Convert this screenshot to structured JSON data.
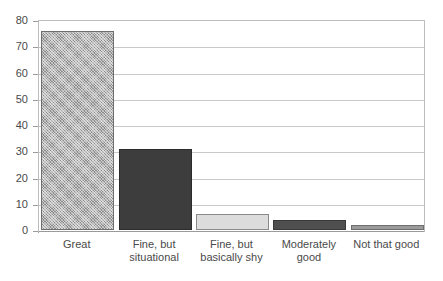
{
  "chart_data": {
    "type": "bar",
    "title": "",
    "subtitle": "",
    "xlabel": "",
    "ylabel": "",
    "categories": [
      "Great",
      "Fine, but\nsituational",
      "Fine, but\nbasically shy",
      "Moderately\ngood",
      "Not that good"
    ],
    "values": [
      76,
      31,
      6,
      4,
      2
    ],
    "ylim": [
      0,
      80
    ],
    "ytick_labels": [
      "0",
      "10",
      "20",
      "30",
      "40",
      "50",
      "60",
      "70",
      "80"
    ],
    "ytick_values": [
      0,
      10,
      20,
      30,
      40,
      50,
      60,
      70,
      80
    ],
    "grid": "horizontal",
    "legend": "none",
    "bar_styles": [
      {
        "fill": "hatched-gray",
        "color": "#8c8c8c",
        "edge": "#6e6e6e"
      },
      {
        "fill": "solid",
        "color": "#3d3d3d",
        "edge": "#2b2b2b"
      },
      {
        "fill": "solid",
        "color": "#dcdcdc",
        "edge": "#8a8a8a"
      },
      {
        "fill": "solid",
        "color": "#4f4f4f",
        "edge": "#3a3a3a"
      },
      {
        "fill": "solid",
        "color": "#9b9b9b",
        "edge": "#6e6e6e"
      }
    ],
    "colors": {
      "background": "#ffffff",
      "gridline": "#c9c9c9",
      "axis": "#9a9a9a",
      "frame": "#bdbdbd",
      "text": "#4a4a4a"
    }
  }
}
